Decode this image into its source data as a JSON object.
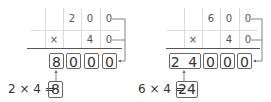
{
  "problems": [
    {
      "top_row": [
        "",
        "2",
        "0",
        "0"
      ],
      "bottom_row": [
        "×",
        "",
        "4",
        "0"
      ],
      "result": [
        "8",
        "0",
        "0",
        "0"
      ],
      "equation": {
        "left": "2 × 4 =",
        "answer": "8"
      }
    },
    {
      "top_row": [
        "",
        "6",
        "0",
        "0"
      ],
      "bottom_row": [
        "×",
        "",
        "4",
        "0"
      ],
      "result": [
        "2 4",
        "0",
        "0",
        "0"
      ],
      "equation": {
        "left": "6 × 4 =",
        "answer": "24"
      }
    }
  ],
  "colors": {
    "grid": "#dcdcdc",
    "box_border": "#666666",
    "text": "#333333"
  }
}
